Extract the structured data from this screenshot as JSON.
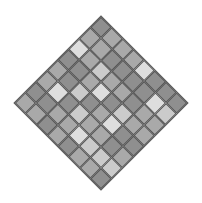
{
  "palette": {
    "D": "#8f8f8f",
    "M": "#a9a9a9",
    "L": "#cbcbcb",
    "X": "#dedede"
  },
  "grid_line_color": "#555555",
  "board": {
    "rows": 8,
    "cols": 8,
    "rotation_deg": 45,
    "cells": [
      [
        "D",
        "M",
        "M",
        "M",
        "X",
        "D",
        "D",
        "D"
      ],
      [
        "M",
        "M",
        "D",
        "D",
        "D",
        "D",
        "X",
        "L"
      ],
      [
        "X",
        "M",
        "L",
        "M",
        "M",
        "D",
        "M",
        "M"
      ],
      [
        "D",
        "D",
        "M",
        "X",
        "D",
        "L",
        "M",
        "M"
      ],
      [
        "M",
        "D",
        "L",
        "D",
        "M",
        "X",
        "D",
        "D"
      ],
      [
        "M",
        "X",
        "D",
        "L",
        "M",
        "M",
        "D",
        "M"
      ],
      [
        "D",
        "D",
        "M",
        "M",
        "X",
        "L",
        "L",
        "L"
      ],
      [
        "M",
        "M",
        "D",
        "M",
        "D",
        "M",
        "M",
        "D"
      ]
    ]
  }
}
